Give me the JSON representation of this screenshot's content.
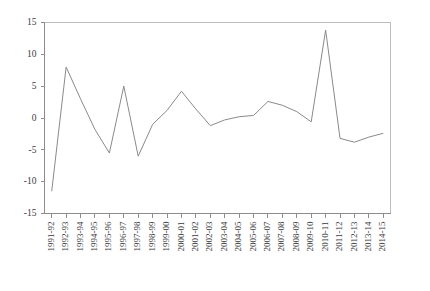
{
  "chart_data": {
    "type": "line",
    "title": "",
    "subtitle": "",
    "xlabel": "",
    "ylabel": "",
    "ylim": [
      -15,
      15
    ],
    "ytick_values": [
      15,
      10,
      5,
      0,
      -5,
      -10,
      -15
    ],
    "ytick_labels": [
      "15",
      "10",
      "5",
      "0",
      "-5",
      "-10",
      "-15"
    ],
    "grid": false,
    "legend": "none",
    "categories": [
      "1991-92",
      "1992-93",
      "1993-94",
      "1994-95",
      "1995-96",
      "1996-97",
      "1997-98",
      "1998-99",
      "1999-00",
      "2000-01",
      "2001-02",
      "2002-03",
      "2003-04",
      "2004-05",
      "2005-06",
      "2006-07",
      "2007-08",
      "2008-09",
      "2009-10",
      "2010-11",
      "2011-12",
      "2012-13",
      "2013-14",
      "2014-15"
    ],
    "values": [
      -11.5,
      8.0,
      3.0,
      -1.8,
      -5.5,
      5.0,
      -6.0,
      -1.0,
      1.2,
      4.2,
      1.4,
      -1.2,
      -0.3,
      0.2,
      0.4,
      2.6,
      2.0,
      1.0,
      -0.6,
      13.8,
      -3.2,
      -3.8,
      -3.0,
      -2.4
    ],
    "series": [
      {
        "name": "series-1",
        "color": "#8a8a8a",
        "values": [
          -11.5,
          8.0,
          3.0,
          -1.8,
          -5.5,
          5.0,
          -6.0,
          -1.0,
          1.2,
          4.2,
          1.4,
          -1.2,
          -0.3,
          0.2,
          0.4,
          2.6,
          2.0,
          1.0,
          -0.6,
          13.8,
          -3.2,
          -3.8,
          -3.0,
          -2.4
        ]
      }
    ]
  },
  "style": {
    "line_color": "#8a8a8a",
    "axis_color": "#8d8d8d",
    "frame_color": "#bdbdbd",
    "label_color": "#3a3a3a",
    "background": "#ffffff"
  }
}
